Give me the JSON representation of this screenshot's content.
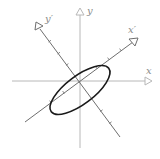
{
  "diagram": {
    "labels": {
      "x": "x",
      "y": "y",
      "x_prime": "x′",
      "y_prime": "y′"
    },
    "colors": {
      "original_axes": "#b8b8b8",
      "rotated_axes": "#6e6e6e",
      "ellipse": "#1a1a1a",
      "labels": "#8a8a8a"
    },
    "geometry": {
      "origin": [
        80,
        81
      ],
      "rotation_deg": -37,
      "ellipse_semi_major": 36,
      "ellipse_semi_minor": 14
    }
  }
}
